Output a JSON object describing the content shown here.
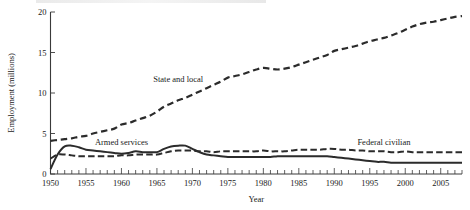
{
  "chart_data": {
    "type": "line",
    "title": "",
    "xlabel": "Year",
    "ylabel": "Employment (millions)",
    "xlim": [
      1950,
      2008
    ],
    "ylim": [
      0,
      20
    ],
    "grid": false,
    "legend_position": "inline-annotations",
    "y_ticks": [
      0,
      5,
      10,
      15,
      20
    ],
    "x_ticks": [
      1950,
      1955,
      1960,
      1965,
      1970,
      1975,
      1980,
      1985,
      1990,
      1995,
      2000,
      2005
    ],
    "x_minor_tick_interval": 1,
    "series": [
      {
        "name": "State and local",
        "style": "long-dashed",
        "label_x": 1968,
        "label_y": 11.3,
        "x": [
          1950,
          1951,
          1952,
          1953,
          1954,
          1955,
          1956,
          1957,
          1958,
          1959,
          1960,
          1961,
          1962,
          1963,
          1964,
          1965,
          1966,
          1967,
          1968,
          1969,
          1970,
          1971,
          1972,
          1973,
          1974,
          1975,
          1976,
          1977,
          1978,
          1979,
          1980,
          1981,
          1982,
          1983,
          1984,
          1985,
          1986,
          1987,
          1988,
          1989,
          1990,
          1991,
          1992,
          1993,
          1994,
          1995,
          1996,
          1997,
          1998,
          1999,
          2000,
          2001,
          2002,
          2003,
          2004,
          2005,
          2006,
          2007,
          2008
        ],
        "values": [
          4.1,
          4.2,
          4.3,
          4.4,
          4.6,
          4.7,
          5.0,
          5.2,
          5.4,
          5.6,
          6.1,
          6.3,
          6.6,
          6.9,
          7.2,
          7.7,
          8.3,
          8.7,
          9.1,
          9.4,
          9.8,
          10.2,
          10.6,
          11.0,
          11.4,
          11.9,
          12.1,
          12.3,
          12.6,
          12.9,
          13.1,
          13.0,
          12.9,
          13.0,
          13.2,
          13.5,
          13.8,
          14.1,
          14.4,
          14.7,
          15.2,
          15.4,
          15.6,
          15.8,
          16.1,
          16.4,
          16.6,
          16.8,
          17.1,
          17.4,
          17.8,
          18.2,
          18.5,
          18.7,
          18.8,
          19.0,
          19.2,
          19.4,
          19.5
        ]
      },
      {
        "name": "Armed services",
        "style": "solid",
        "label_x": 1960,
        "label_y": 3.6,
        "x": [
          1950,
          1951,
          1952,
          1953,
          1954,
          1955,
          1956,
          1957,
          1958,
          1959,
          1960,
          1961,
          1962,
          1963,
          1964,
          1965,
          1966,
          1967,
          1968,
          1969,
          1970,
          1971,
          1972,
          1973,
          1974,
          1975,
          1976,
          1977,
          1978,
          1979,
          1980,
          1981,
          1982,
          1983,
          1984,
          1985,
          1986,
          1987,
          1988,
          1989,
          1990,
          1991,
          1992,
          1993,
          1994,
          1995,
          1996,
          1997,
          1998,
          1999,
          2000,
          2001,
          2002,
          2003,
          2004,
          2005,
          2006,
          2007,
          2008
        ],
        "values": [
          0.6,
          2.4,
          3.4,
          3.5,
          3.3,
          3.0,
          2.9,
          2.8,
          2.7,
          2.6,
          2.5,
          2.6,
          2.8,
          2.7,
          2.7,
          2.7,
          3.1,
          3.4,
          3.5,
          3.5,
          3.1,
          2.7,
          2.4,
          2.3,
          2.2,
          2.1,
          2.1,
          2.1,
          2.1,
          2.1,
          2.1,
          2.1,
          2.2,
          2.2,
          2.2,
          2.2,
          2.2,
          2.2,
          2.2,
          2.2,
          2.1,
          2.0,
          1.9,
          1.8,
          1.7,
          1.6,
          1.5,
          1.5,
          1.4,
          1.4,
          1.4,
          1.4,
          1.4,
          1.4,
          1.4,
          1.4,
          1.4,
          1.4,
          1.4
        ]
      },
      {
        "name": "Federal civilian",
        "style": "dashed",
        "label_x": 1997,
        "label_y": 3.6,
        "x": [
          1950,
          1951,
          1952,
          1953,
          1954,
          1955,
          1956,
          1957,
          1958,
          1959,
          1960,
          1961,
          1962,
          1963,
          1964,
          1965,
          1966,
          1967,
          1968,
          1969,
          1970,
          1971,
          1972,
          1973,
          1974,
          1975,
          1976,
          1977,
          1978,
          1979,
          1980,
          1981,
          1982,
          1983,
          1984,
          1985,
          1986,
          1987,
          1988,
          1989,
          1990,
          1991,
          1992,
          1993,
          1994,
          1995,
          1996,
          1997,
          1998,
          1999,
          2000,
          2001,
          2002,
          2003,
          2004,
          2005,
          2006,
          2007,
          2008
        ],
        "values": [
          1.9,
          2.4,
          2.4,
          2.3,
          2.2,
          2.2,
          2.2,
          2.2,
          2.2,
          2.2,
          2.3,
          2.3,
          2.4,
          2.4,
          2.4,
          2.4,
          2.6,
          2.8,
          2.9,
          2.9,
          2.9,
          2.8,
          2.8,
          2.7,
          2.8,
          2.8,
          2.8,
          2.8,
          2.8,
          2.8,
          2.9,
          2.8,
          2.8,
          2.8,
          2.9,
          3.0,
          3.0,
          3.0,
          3.0,
          3.1,
          3.1,
          3.0,
          3.0,
          2.9,
          2.9,
          2.8,
          2.8,
          2.8,
          2.7,
          2.7,
          2.8,
          2.7,
          2.7,
          2.7,
          2.7,
          2.7,
          2.7,
          2.7,
          2.7
        ]
      }
    ]
  }
}
